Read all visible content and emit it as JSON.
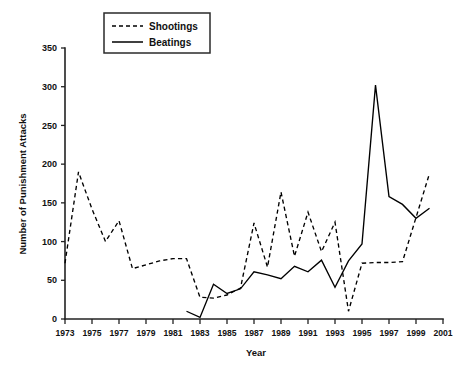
{
  "chart_data": {
    "type": "line",
    "title": "",
    "xlabel": "Year",
    "ylabel": "Number of Punishment Attacks",
    "xlim": [
      1973,
      2001
    ],
    "ylim": [
      0,
      350
    ],
    "yticks": [
      0,
      50,
      100,
      150,
      200,
      250,
      300,
      350
    ],
    "xticks": [
      1973,
      1975,
      1977,
      1979,
      1981,
      1983,
      1985,
      1987,
      1989,
      1991,
      1993,
      1995,
      1997,
      1999,
      2001
    ],
    "grid": false,
    "legend_position": "top-center",
    "x": [
      1973,
      1974,
      1975,
      1976,
      1977,
      1978,
      1979,
      1980,
      1981,
      1982,
      1983,
      1984,
      1985,
      1986,
      1987,
      1988,
      1989,
      1990,
      1991,
      1992,
      1993,
      1994,
      1995,
      1996,
      1997,
      1998,
      1999,
      2000
    ],
    "series": [
      {
        "name": "Shootings",
        "style": "dashed",
        "x": [
          1973,
          1974,
          1975,
          1976,
          1977,
          1978,
          1979,
          1980,
          1981,
          1982,
          1983,
          1984,
          1985,
          1986,
          1987,
          1988,
          1989,
          1990,
          1991,
          1992,
          1993,
          1994,
          1995,
          1996,
          1997,
          1998,
          1999,
          2000
        ],
        "values": [
          72,
          190,
          142,
          100,
          127,
          65,
          70,
          75,
          78,
          78,
          28,
          27,
          31,
          40,
          124,
          67,
          164,
          81,
          138,
          87,
          125,
          10,
          72,
          73,
          73,
          74,
          131,
          188
        ]
      },
      {
        "name": "Beatings",
        "style": "solid",
        "x": [
          1982,
          1983,
          1984,
          1985,
          1986,
          1987,
          1988,
          1989,
          1990,
          1991,
          1992,
          1993,
          1994,
          1995,
          1996,
          1997,
          1998,
          1999,
          2000
        ],
        "values": [
          10,
          2,
          45,
          33,
          39,
          61,
          57,
          52,
          68,
          61,
          76,
          41,
          75,
          97,
          302,
          158,
          148,
          130,
          143
        ]
      }
    ],
    "legend": [
      {
        "label": "Shootings",
        "style": "dashed"
      },
      {
        "label": "Beatings",
        "style": "solid"
      }
    ]
  },
  "axis": {
    "y_title": "Number of Punishment Attacks",
    "x_title": "Year",
    "ytick_labels": [
      "0",
      "50",
      "100",
      "150",
      "200",
      "250",
      "300",
      "350"
    ],
    "xtick_labels": [
      "1973",
      "1975",
      "1977",
      "1979",
      "1981",
      "1983",
      "1985",
      "1987",
      "1989",
      "1991",
      "1993",
      "1995",
      "1997",
      "1999",
      "2001"
    ]
  },
  "legend": {
    "shootings_label": "Shootings",
    "beatings_label": "Beatings"
  },
  "colors": {
    "ink": "#000000",
    "axis": "#222222",
    "background": "#ffffff"
  }
}
